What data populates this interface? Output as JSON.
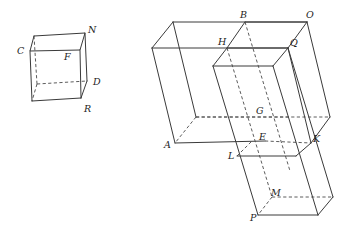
{
  "figure": {
    "background_color": "#ffffff",
    "edge_color": "#3a3a3a",
    "hidden_edge_color": "#4a4a4a",
    "label_color": "#1d1d1d",
    "shapes": [
      {
        "name": "small-box",
        "kind": "rectangular-solid",
        "labels": [
          "C",
          "N",
          "F",
          "D",
          "R"
        ]
      },
      {
        "name": "large-composite-box",
        "kind": "interlocking-rectangular-solids",
        "labels": [
          "B",
          "O",
          "H",
          "Q",
          "G",
          "A",
          "E",
          "K",
          "L",
          "M",
          "P"
        ]
      }
    ]
  },
  "labels": {
    "C": "C",
    "N": "N",
    "F": "F",
    "D": "D",
    "R": "R",
    "A": "A",
    "B": "B",
    "O": "O",
    "H": "H",
    "Q": "Q",
    "G": "G",
    "E": "E",
    "K": "K",
    "L": "L",
    "M": "M",
    "P": "P"
  }
}
